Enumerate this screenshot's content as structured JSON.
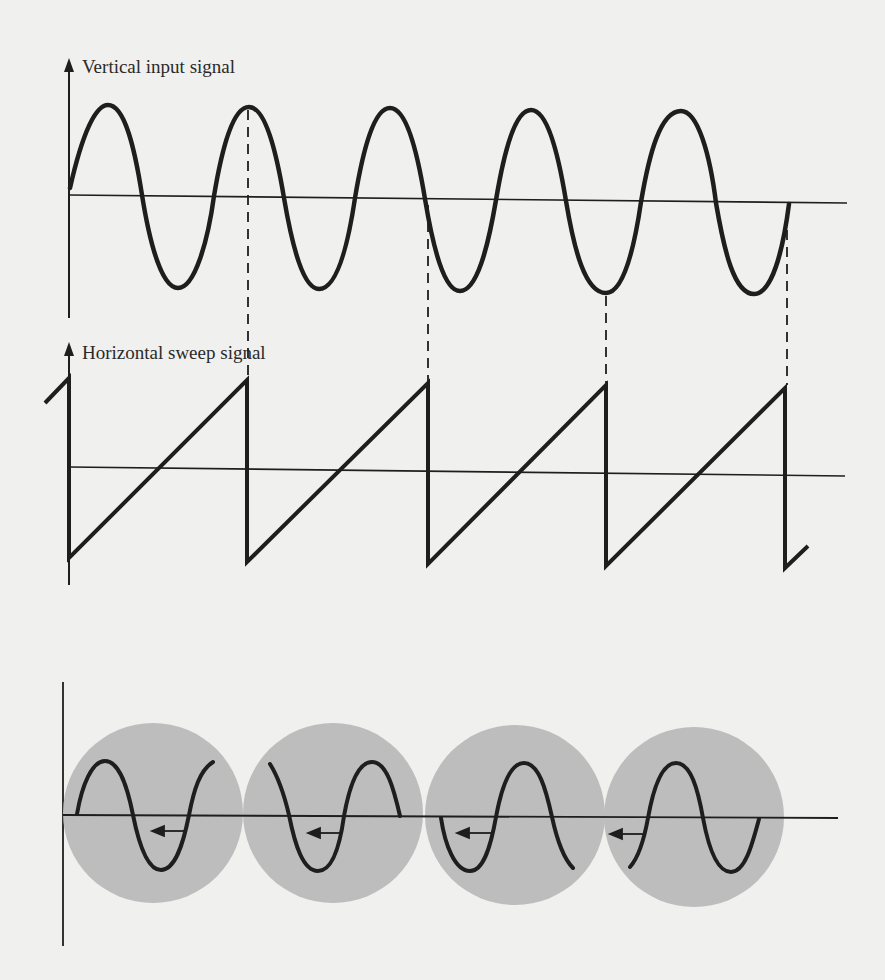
{
  "diagram": {
    "panels": [
      {
        "id": "vertical",
        "label": "Vertical input signal",
        "waveform": "sine",
        "cycles_shown": 4.75
      },
      {
        "id": "horizontal",
        "label": "Horizontal sweep signal",
        "waveform": "sawtooth",
        "sweeps_shown": 4
      },
      {
        "id": "screen",
        "label": "",
        "description": "Successive traces displayed on the screen; each sweep starts at a different phase, so the trace drifts (arrows point left)",
        "circles": 4
      }
    ],
    "colors": {
      "background": "#f0f0ee",
      "stroke": "#1e1e1e",
      "circle_fill": "#bdbdbd"
    }
  }
}
